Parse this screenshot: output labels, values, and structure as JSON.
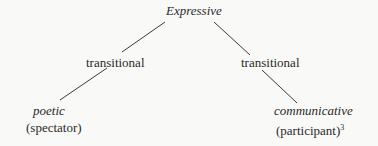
{
  "diagram": {
    "root": {
      "label": "Expressive",
      "style": "italic"
    },
    "left_branch": {
      "intermediate": "transitional",
      "leaf": {
        "label": "poetic",
        "style": "italic",
        "role": "(spectator)"
      }
    },
    "right_branch": {
      "intermediate": "transitional",
      "leaf": {
        "label": "communicative",
        "style": "italic",
        "role": "(participant)",
        "footnote": "3"
      }
    },
    "line_color": "#3a3a3a",
    "background": "#f9f9f7"
  }
}
